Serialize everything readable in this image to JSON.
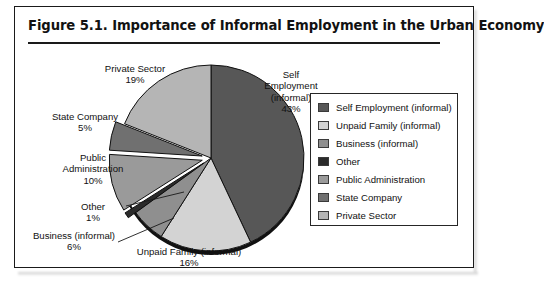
{
  "figure": {
    "title": "Figure 5.1.  Importance of Informal Employment in the Urban Economy"
  },
  "chart_data": {
    "type": "pie",
    "title": "Figure 5.1.  Importance of Informal Employment in the Urban Economy",
    "xlabel": "",
    "ylabel": "",
    "unit": "percent",
    "start_angle_deg": 0,
    "direction": "clockwise",
    "legend_position": "right",
    "grid": false,
    "categories": [
      "Self Employment (informal)",
      "Unpaid Family (informal)",
      "Business (informal)",
      "Other",
      "Public Administration",
      "State Company",
      "Private Sector"
    ],
    "values": [
      43,
      16,
      6,
      1,
      10,
      5,
      19
    ],
    "colors": [
      "#575757",
      "#d3d3d3",
      "#8f8f8f",
      "#2b2b2b",
      "#9a9a9a",
      "#707070",
      "#b5b5b5"
    ],
    "exploded": [
      false,
      false,
      false,
      true,
      true,
      true,
      false
    ],
    "slices": [
      {
        "label": "Self Employment (informal)",
        "value": 43,
        "display": "43%",
        "color": "#575757"
      },
      {
        "label": "Unpaid Family (informal)",
        "value": 16,
        "display": "16%",
        "color": "#d3d3d3"
      },
      {
        "label": "Business (informal)",
        "value": 6,
        "display": "6%",
        "color": "#8f8f8f"
      },
      {
        "label": "Other",
        "value": 1,
        "display": "1%",
        "color": "#2b2b2b"
      },
      {
        "label": "Public Administration",
        "value": 10,
        "display": "10%",
        "color": "#9a9a9a"
      },
      {
        "label": "State Company",
        "value": 5,
        "display": "5%",
        "color": "#707070"
      },
      {
        "label": "Private Sector",
        "value": 19,
        "display": "19%",
        "color": "#b5b5b5"
      }
    ]
  },
  "callouts": {
    "self_employment": {
      "line1": "Self",
      "line2": "Employment",
      "line3": "(informal)",
      "pct": "43%"
    },
    "private_sector": {
      "line1": "Private Sector",
      "pct": "19%"
    },
    "state_company": {
      "line1": "State Company",
      "pct": "5%"
    },
    "public_administration": {
      "line1": "Public",
      "line2": "Administration",
      "pct": "10%"
    },
    "other": {
      "line1": "Other",
      "pct": "1%"
    },
    "business": {
      "line1": "Business (informal)",
      "pct": "6%"
    },
    "unpaid_family": {
      "line1": "Unpaid Family (informal)",
      "pct": "16%"
    }
  },
  "legend": {
    "items": [
      {
        "label": "Self Employment (informal)",
        "color": "#575757"
      },
      {
        "label": "Unpaid Family (informal)",
        "color": "#d3d3d3"
      },
      {
        "label": "Business (informal)",
        "color": "#8f8f8f"
      },
      {
        "label": "Other",
        "color": "#2b2b2b"
      },
      {
        "label": "Public Administration",
        "color": "#9a9a9a"
      },
      {
        "label": "State Company",
        "color": "#707070"
      },
      {
        "label": "Private Sector",
        "color": "#b5b5b5"
      }
    ]
  }
}
